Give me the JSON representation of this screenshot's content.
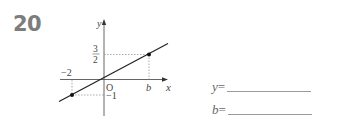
{
  "question": {
    "number": "20"
  },
  "graph": {
    "axis_x_label": "x",
    "axis_y_label": "y",
    "origin_label": "O",
    "tick_neg2": "−2",
    "tick_b": "b",
    "tick_neg1": "−1",
    "frac_num": "3",
    "frac_den": "2",
    "points": [
      {
        "x": -2,
        "y": -1
      },
      {
        "x": "b",
        "y": "3/2"
      }
    ]
  },
  "answers": [
    {
      "var": "y",
      "eq": "=",
      "value": ""
    },
    {
      "var": "b",
      "eq": "=",
      "value": ""
    }
  ]
}
